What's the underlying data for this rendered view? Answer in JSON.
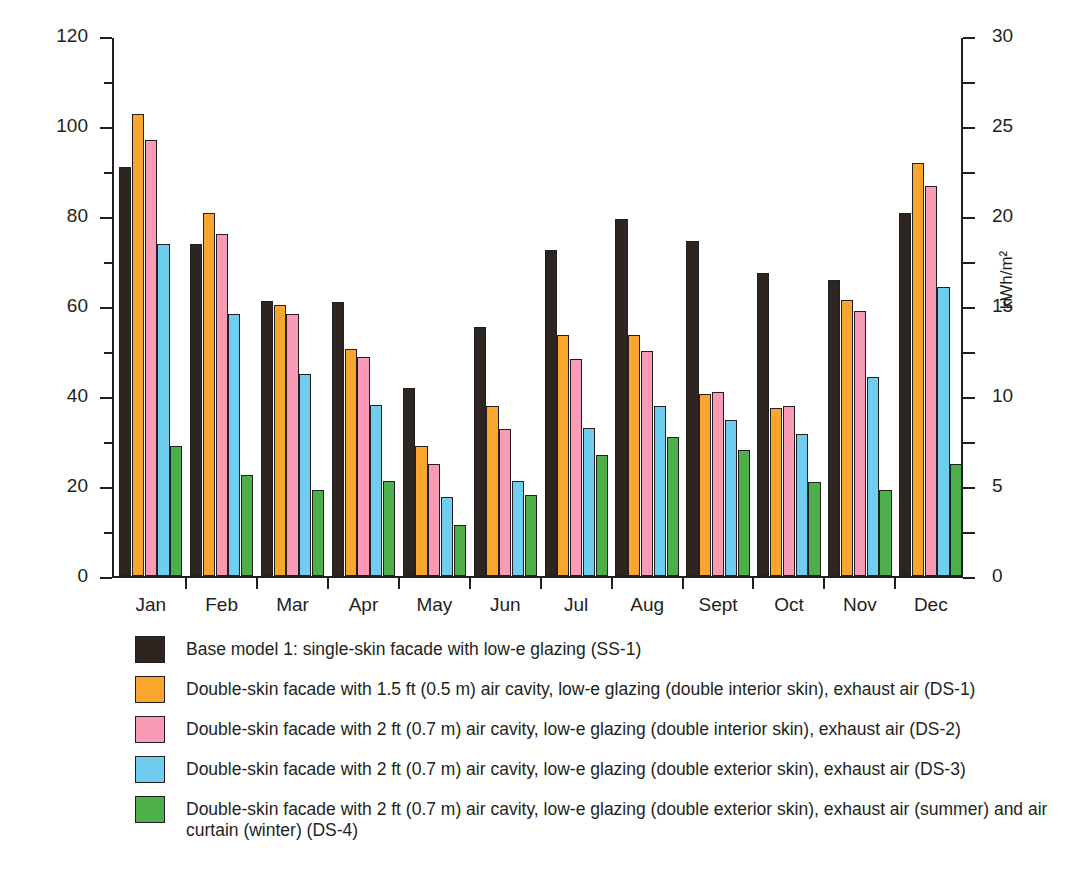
{
  "chart_data": {
    "type": "bar",
    "title": "",
    "categories": [
      "Jan",
      "Feb",
      "Mar",
      "Apr",
      "May",
      "Jun",
      "Jul",
      "Aug",
      "Sept",
      "Oct",
      "Nov",
      "Dec"
    ],
    "xlabel": "",
    "ylabel": "kBtu/ft²",
    "ylabel_right": "kWh/m²",
    "ylim": [
      0,
      120
    ],
    "ylim_right": [
      0,
      30
    ],
    "yticks": [
      0,
      20,
      40,
      60,
      80,
      100,
      120
    ],
    "yticks_right": [
      0,
      5,
      10,
      15,
      20,
      25,
      30
    ],
    "yticklabels": [
      "0",
      "20",
      "40",
      "60",
      "80",
      "100",
      "120"
    ],
    "yticklabels_right": [
      "0",
      "5",
      "10",
      "15",
      "20",
      "25",
      "30"
    ],
    "grid": false,
    "legend_position": "below",
    "series": [
      {
        "name": "SS-1",
        "label": "Base model 1: single-skin facade with low-e glazing (SS-1)",
        "color": "#2e2520",
        "values": [
          90.8,
          73.7,
          61.2,
          61.0,
          41.8,
          55.3,
          72.5,
          79.4,
          74.4,
          67.4,
          65.7,
          80.6
        ]
      },
      {
        "name": "DS-1",
        "label": "Double-skin facade with 1.5 ft (0.5 m) air cavity, low-e glazing (double interior skin), exhaust air (DS-1)",
        "color": "#f9a52e",
        "values": [
          102.7,
          80.6,
          60.2,
          50.5,
          28.9,
          37.7,
          53.6,
          53.5,
          40.4,
          37.4,
          61.4,
          91.7
        ]
      },
      {
        "name": "DS-2",
        "label": "Double-skin facade with 2 ft (0.7 m) air cavity, low-e glazing (double interior skin), exhaust air (DS-2)",
        "color": "#f99bb4",
        "values": [
          96.8,
          76.1,
          58.2,
          48.7,
          24.8,
          32.6,
          48.2,
          50.1,
          40.9,
          37.8,
          58.9,
          86.6
        ]
      },
      {
        "name": "DS-3",
        "label": "Double-skin facade with 2 ft (0.7 m) air cavity, low-e glazing (double exterior skin), exhaust air (DS-3)",
        "color": "#6fcef0",
        "values": [
          73.8,
          58.2,
          44.8,
          38.1,
          17.5,
          21.2,
          33.0,
          37.8,
          34.7,
          31.6,
          44.3,
          64.3
        ]
      },
      {
        "name": "DS-4",
        "label": "Double-skin facade with 2 ft (0.7 m) air cavity, low-e glazing (double exterior skin), exhaust air (summer) and air curtain (winter) (DS-4)",
        "color": "#4caf4a",
        "values": [
          28.8,
          22.4,
          19.2,
          21.1,
          11.4,
          17.9,
          26.9,
          30.8,
          27.9,
          20.8,
          19.1,
          24.8
        ]
      }
    ]
  },
  "caption": {
    "text": ""
  }
}
